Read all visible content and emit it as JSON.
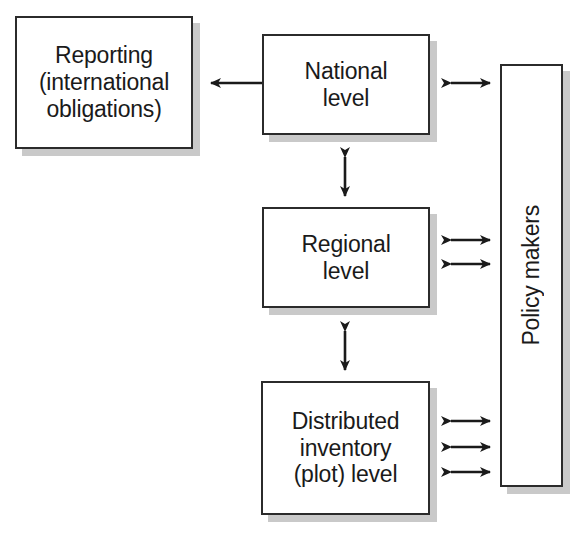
{
  "diagram": {
    "background_color": "#ffffff",
    "border_color": "#2b2b2b",
    "shadow_color": "#c9c9c9",
    "nodes": [
      {
        "id": "reporting",
        "label": "Reporting\n(international\nobligations)",
        "x": 15,
        "y": 16,
        "w": 178,
        "h": 133
      },
      {
        "id": "national",
        "label": "National\nlevel",
        "x": 262,
        "y": 34,
        "w": 168,
        "h": 101
      },
      {
        "id": "regional",
        "label": "Regional\nlevel",
        "x": 262,
        "y": 207,
        "w": 168,
        "h": 101
      },
      {
        "id": "plot",
        "label": "Distributed\ninventory\n(plot) level",
        "x": 261,
        "y": 381,
        "w": 169,
        "h": 134
      },
      {
        "id": "policy",
        "label": "Policy makers",
        "x": 500,
        "y": 64,
        "w": 63,
        "h": 423,
        "orientation": "vertical"
      }
    ],
    "connectors": [
      {
        "id": "national-to-reporting",
        "from": "national",
        "to": "reporting",
        "direction": "single-left",
        "x1": 262,
        "y1": 83,
        "x2": 200,
        "y2": 83
      },
      {
        "id": "national-to-policy",
        "from": "national",
        "to": "policy",
        "direction": "double-horizontal",
        "x1": 440,
        "y1": 83,
        "x2": 500,
        "y2": 83
      },
      {
        "id": "national-regional",
        "from": "national",
        "to": "regional",
        "direction": "double-vertical",
        "x1": 345,
        "y1": 146,
        "x2": 345,
        "y2": 206
      },
      {
        "id": "regional-to-policy-1",
        "from": "regional",
        "to": "policy",
        "direction": "double-horizontal",
        "x1": 440,
        "y1": 240,
        "x2": 500,
        "y2": 240
      },
      {
        "id": "regional-to-policy-2",
        "from": "regional",
        "to": "policy",
        "direction": "double-horizontal",
        "x1": 440,
        "y1": 264,
        "x2": 500,
        "y2": 264
      },
      {
        "id": "regional-plot",
        "from": "regional",
        "to": "plot",
        "direction": "double-vertical",
        "x1": 345,
        "y1": 320,
        "x2": 345,
        "y2": 380
      },
      {
        "id": "plot-to-policy-1",
        "from": "plot",
        "to": "policy",
        "direction": "double-horizontal",
        "x1": 440,
        "y1": 421,
        "x2": 500,
        "y2": 421
      },
      {
        "id": "plot-to-policy-2",
        "from": "plot",
        "to": "policy",
        "direction": "double-horizontal",
        "x1": 440,
        "y1": 447,
        "x2": 500,
        "y2": 447
      },
      {
        "id": "plot-to-policy-3",
        "from": "plot",
        "to": "policy",
        "direction": "double-horizontal",
        "x1": 440,
        "y1": 472,
        "x2": 500,
        "y2": 472
      }
    ]
  }
}
